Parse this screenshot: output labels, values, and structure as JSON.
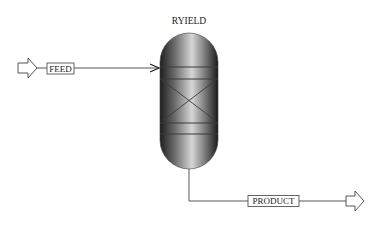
{
  "diagram": {
    "block": {
      "name": "RYIELD",
      "type": "reactor-vessel"
    },
    "streams": [
      {
        "id": "feed",
        "label": "FEED",
        "direction": "inlet"
      },
      {
        "id": "product",
        "label": "PRODUCT",
        "direction": "outlet"
      }
    ],
    "colors": {
      "line": "#333333",
      "vessel_dark": "#2a2a2a",
      "vessel_light": "#d8d8d8",
      "label_border": "#555555"
    }
  }
}
